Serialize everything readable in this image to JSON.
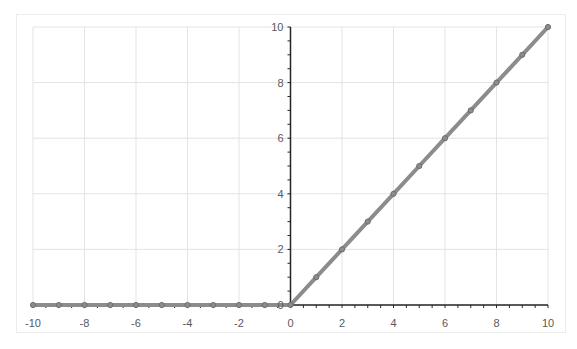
{
  "chart_data": {
    "type": "line",
    "title": "",
    "xlabel": "",
    "ylabel": "",
    "xlim": [
      -10,
      10
    ],
    "ylim": [
      0,
      10
    ],
    "grid": true,
    "legend": null,
    "x_ticks": [
      "-10",
      "-8",
      "-6",
      "-4",
      "-2",
      "0",
      "2",
      "4",
      "6",
      "8",
      "10"
    ],
    "y_ticks": [
      "0",
      "2",
      "4",
      "6",
      "8",
      "10"
    ],
    "series": [
      {
        "name": "ReLU",
        "color": "#8c8c8c",
        "marker": "circle",
        "x": [
          -10,
          -9,
          -8,
          -7,
          -6,
          -5,
          -4,
          -3,
          -2,
          -1,
          0,
          1,
          2,
          3,
          4,
          5,
          6,
          7,
          8,
          9,
          10
        ],
        "values": [
          0,
          0,
          0,
          0,
          0,
          0,
          0,
          0,
          0,
          0,
          0,
          1,
          2,
          3,
          4,
          5,
          6,
          7,
          8,
          9,
          10
        ]
      }
    ]
  },
  "colors": {
    "axis": "#262626",
    "grid": "#e3e3e3",
    "line": "#8c8c8c",
    "marker_edge": "#6e6e6e"
  }
}
